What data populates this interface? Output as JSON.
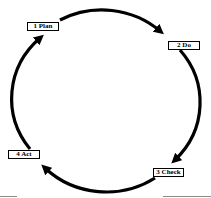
{
  "diagram": {
    "type": "cycle",
    "stages": [
      {
        "order": 1,
        "label": "1 Plan"
      },
      {
        "order": 2,
        "label": "2 Do"
      },
      {
        "order": 3,
        "label": "3 Check"
      },
      {
        "order": 4,
        "label": "4 Act"
      }
    ],
    "flow": [
      {
        "from": "1 Plan",
        "to": "2 Do"
      },
      {
        "from": "2 Do",
        "to": "3 Check"
      },
      {
        "from": "3 Check",
        "to": "4 Act"
      },
      {
        "from": "4 Act",
        "to": "1 Plan"
      }
    ],
    "direction": "clockwise",
    "colors": {
      "arrow": "#000000",
      "label_border": "#000000",
      "label_background": "#ffffff",
      "background": "#ffffff"
    }
  }
}
